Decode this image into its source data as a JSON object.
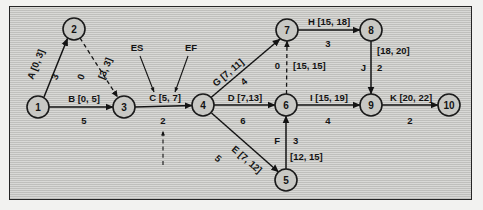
{
  "figure": {
    "type": "activity-on-arrow-network-diagram",
    "background_color": "#c8c8c4",
    "border_color": "#262626",
    "ink_color": "#141414"
  },
  "legend": {
    "es_label": "ES",
    "ef_label": "EF",
    "es_points_to": "5",
    "ef_points_to": "7",
    "note_activity": "C [5, 7]"
  },
  "nodes": [
    {
      "id": "1",
      "label": "1",
      "cx": 38,
      "cy": 107,
      "r": 11
    },
    {
      "id": "2",
      "label": "2",
      "cx": 74,
      "cy": 29,
      "r": 11
    },
    {
      "id": "3",
      "label": "3",
      "cx": 124,
      "cy": 107,
      "r": 11
    },
    {
      "id": "4",
      "label": "4",
      "cx": 203,
      "cy": 105,
      "r": 11
    },
    {
      "id": "5",
      "label": "5",
      "cx": 286,
      "cy": 180,
      "r": 11
    },
    {
      "id": "6",
      "label": "6",
      "cx": 286,
      "cy": 105,
      "r": 11
    },
    {
      "id": "7",
      "label": "7",
      "cx": 287,
      "cy": 30,
      "r": 11
    },
    {
      "id": "8",
      "label": "8",
      "cx": 371,
      "cy": 30,
      "r": 11
    },
    {
      "id": "9",
      "label": "9",
      "cx": 371,
      "cy": 105,
      "r": 11
    },
    {
      "id": "10",
      "label": "10",
      "cx": 449,
      "cy": 105,
      "r": 11
    }
  ],
  "edges": [
    {
      "name": "A",
      "from": "1",
      "to": "2",
      "activity": "A [0, 3]",
      "es": 0,
      "ef": 3,
      "duration": "3",
      "style": "solid"
    },
    {
      "name": "dummy-2-3",
      "from": "2",
      "to": "3",
      "activity": "[3, 3]",
      "es": 3,
      "ef": 3,
      "duration": "0",
      "style": "dashed"
    },
    {
      "name": "B",
      "from": "1",
      "to": "3",
      "activity": "B [0, 5]",
      "es": 0,
      "ef": 5,
      "duration": "5",
      "style": "solid"
    },
    {
      "name": "C",
      "from": "3",
      "to": "4",
      "activity": "C [5, 7]",
      "es": 5,
      "ef": 7,
      "duration": "2",
      "style": "solid"
    },
    {
      "name": "G",
      "from": "4",
      "to": "7",
      "activity": "G [7, 11]",
      "es": 7,
      "ef": 11,
      "duration": "4",
      "style": "solid"
    },
    {
      "name": "D",
      "from": "4",
      "to": "6",
      "activity": "D [7,13]",
      "es": 7,
      "ef": 13,
      "duration": "6",
      "style": "solid"
    },
    {
      "name": "E",
      "from": "4",
      "to": "5",
      "activity": "E [7, 12]",
      "es": 7,
      "ef": 12,
      "duration": "5",
      "style": "solid"
    },
    {
      "name": "F",
      "from": "5",
      "to": "6",
      "activity": "F",
      "window": "[12, 15]",
      "es": 12,
      "ef": 15,
      "duration": "3",
      "style": "solid"
    },
    {
      "name": "dummy-6-7",
      "from": "6",
      "to": "7",
      "activity": "[15, 15]",
      "es": 15,
      "ef": 15,
      "duration": "0",
      "style": "dashed"
    },
    {
      "name": "H",
      "from": "7",
      "to": "8",
      "activity": "H [15, 18]",
      "es": 15,
      "ef": 18,
      "duration": "3",
      "style": "solid"
    },
    {
      "name": "I",
      "from": "6",
      "to": "9",
      "activity": "I [15, 19]",
      "es": 15,
      "ef": 19,
      "duration": "4",
      "style": "solid"
    },
    {
      "name": "J",
      "from": "8",
      "to": "9",
      "activity": "J",
      "window": "[18, 20]",
      "es": 18,
      "ef": 20,
      "duration": "2",
      "style": "solid"
    },
    {
      "name": "K",
      "from": "9",
      "to": "10",
      "activity": "K [20, 22]",
      "es": 20,
      "ef": 22,
      "duration": "2",
      "style": "solid"
    }
  ],
  "labels": {
    "a_activity": "A [0, 3]",
    "a_duration": "3",
    "dummy23_duration": "0",
    "dummy23_window": "[3, 3]",
    "b_activity": "B [0, 5]",
    "b_duration": "5",
    "c_activity": "C [5, 7]",
    "c_duration": "2",
    "es": "ES",
    "ef": "EF",
    "g_activity": "G [7, 11]",
    "g_duration": "4",
    "d_activity": "D [7,13]",
    "d_duration": "6",
    "e_activity": "E [7, 12]",
    "e_duration": "5",
    "f_activity": "F",
    "f_duration": "3",
    "f_window": "[12, 15]",
    "dummy67_duration": "0",
    "dummy67_window": "[15, 15]",
    "h_activity": "H [15, 18]",
    "h_duration": "3",
    "i_activity": "I [15, 19]",
    "i_duration": "4",
    "j_activity": "J",
    "j_duration": "2",
    "j_window": "[18, 20]",
    "k_activity": "K [20, 22]",
    "k_duration": "2"
  }
}
